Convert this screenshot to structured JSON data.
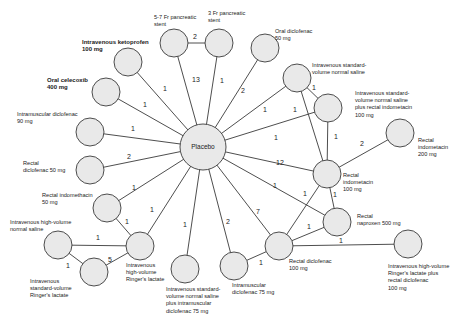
{
  "diagram": {
    "center_node": {
      "id": "placebo",
      "label": "Placebo",
      "x": 203,
      "y": 147,
      "r": 23
    },
    "nodes": [
      {
        "id": "iv_ketoprofen",
        "label": "Intravenous ketoprofen\n100 mg",
        "x": 128,
        "y": 62,
        "r": 14,
        "lx": 82,
        "ly": 39,
        "bold": true
      },
      {
        "id": "oral_celecoxib",
        "label": "Oral celecoxib\n400 mg",
        "x": 106,
        "y": 92,
        "r": 14,
        "lx": 47,
        "ly": 77,
        "bold": true
      },
      {
        "id": "im_diclofenac_90",
        "label": "Intramuscular diclofenac\n90 mg",
        "x": 90,
        "y": 132,
        "r": 14,
        "lx": 17,
        "ly": 111
      },
      {
        "id": "rectal_diclofenac_50",
        "label": "Rectal\ndiclofenac 50 mg",
        "x": 90,
        "y": 170,
        "r": 14,
        "lx": 23,
        "ly": 160
      },
      {
        "id": "rectal_indomethacin_50",
        "label": "Rectal indomethacin\n50 mg",
        "x": 107,
        "y": 208,
        "r": 14,
        "lx": 42,
        "ly": 192
      },
      {
        "id": "iv_hv_ns",
        "label": "Intravenous high-volume\nnormal saline",
        "x": 58,
        "y": 245,
        "r": 14,
        "lx": 10,
        "ly": 219
      },
      {
        "id": "iv_sv_rl",
        "label": "Intravenous\nstandard-volume\nRinger's lactate",
        "x": 94,
        "y": 272,
        "r": 14,
        "lx": 30,
        "ly": 278
      },
      {
        "id": "iv_hv_rl",
        "label": "Intravenous\nhigh-volume\nRinger's lactate",
        "x": 140,
        "y": 246,
        "r": 14,
        "lx": 126,
        "ly": 262
      },
      {
        "id": "iv_sv_ns_im_dic",
        "label": "Intravenous standard-\nvolume normal saline\nplus intramuscular\ndiclofenac 75 mg",
        "x": 185,
        "y": 269,
        "r": 14,
        "lx": 166,
        "ly": 286
      },
      {
        "id": "im_diclofenac_75",
        "label": "Intramuscular\ndiclofenac 75 mg",
        "x": 234,
        "y": 266,
        "r": 14,
        "lx": 232,
        "ly": 282
      },
      {
        "id": "rectal_diclofenac_100",
        "label": "Rectal diclofenac\n100 mg",
        "x": 279,
        "y": 246,
        "r": 14,
        "lx": 289,
        "ly": 258
      },
      {
        "id": "rectal_naproxen_500",
        "label": "Rectal\nnaproxen 500 mg",
        "x": 337,
        "y": 222,
        "r": 14,
        "lx": 357,
        "ly": 213
      },
      {
        "id": "iv_hv_rl_rectal_dic",
        "label": "Intravenous high-volume\nRinger's lactate plus\nrectal diclofenac\n100 mg",
        "x": 408,
        "y": 244,
        "r": 14,
        "lx": 388,
        "ly": 263
      },
      {
        "id": "rectal_indomethacin_100",
        "label": "Rectal\nindometacin\n100 mg",
        "x": 327,
        "y": 174,
        "r": 14,
        "lx": 343,
        "ly": 172
      },
      {
        "id": "rectal_indomethacin_200",
        "label": "Rectal\nindometacin\n200 mg",
        "x": 400,
        "y": 133,
        "r": 14,
        "lx": 418,
        "ly": 137
      },
      {
        "id": "iv_sv_ns_rectal_indo",
        "label": "Intravenous standard-\nvolume normal saline\nplus rectal indometacin\n100 mg",
        "x": 328,
        "y": 108,
        "r": 14,
        "lx": 355,
        "ly": 90
      },
      {
        "id": "iv_sv_ns",
        "label": "Intravenous standard-\nvolume normal saline",
        "x": 297,
        "y": 78,
        "r": 14,
        "lx": 312,
        "ly": 62
      },
      {
        "id": "oral_diclofenac",
        "label": "Oral diclofenac\n50 mg",
        "x": 265,
        "y": 48,
        "r": 14,
        "lx": 275,
        "ly": 28
      },
      {
        "id": "stent_3fr",
        "label": "3 Fr pancreatic\nstent",
        "x": 219,
        "y": 43,
        "r": 14,
        "lx": 208,
        "ly": 10
      },
      {
        "id": "stent_5_7fr",
        "label": "5-7 Fr pancreatic\nstent",
        "x": 174,
        "y": 43,
        "r": 14,
        "lx": 154,
        "ly": 14
      }
    ],
    "edges": [
      {
        "a": "placebo",
        "b": "iv_ketoprofen",
        "n": "1",
        "lx": 165,
        "ly": 91
      },
      {
        "a": "placebo",
        "b": "oral_celecoxib",
        "n": "1",
        "lx": 145,
        "ly": 107
      },
      {
        "a": "placebo",
        "b": "im_diclofenac_90",
        "n": "1",
        "lx": 133,
        "ly": 131
      },
      {
        "a": "placebo",
        "b": "rectal_diclofenac_50",
        "n": "2",
        "lx": 129,
        "ly": 159
      },
      {
        "a": "placebo",
        "b": "rectal_indomethacin_50",
        "n": "1",
        "lx": 134,
        "ly": 190
      },
      {
        "a": "placebo",
        "b": "iv_hv_rl",
        "n": "1",
        "lx": 152,
        "ly": 212
      },
      {
        "a": "placebo",
        "b": "iv_sv_ns_im_dic",
        "n": "1",
        "lx": 185,
        "ly": 227
      },
      {
        "a": "placebo",
        "b": "im_diclofenac_75",
        "n": "2",
        "lx": 228,
        "ly": 224
      },
      {
        "a": "placebo",
        "b": "rectal_diclofenac_100",
        "n": "7",
        "lx": 258,
        "ly": 214
      },
      {
        "a": "placebo",
        "b": "rectal_naproxen_500",
        "n": "1",
        "lx": 275,
        "ly": 188
      },
      {
        "a": "placebo",
        "b": "rectal_indomethacin_100",
        "n": "12",
        "lx": 280,
        "ly": 165
      },
      {
        "a": "placebo",
        "b": "iv_sv_ns_rectal_indo",
        "n": "1",
        "lx": 276,
        "ly": 140
      },
      {
        "a": "placebo",
        "b": "iv_sv_ns",
        "n": "1",
        "lx": 265,
        "ly": 112
      },
      {
        "a": "placebo",
        "b": "oral_diclofenac",
        "n": "2",
        "lx": 243,
        "ly": 93
      },
      {
        "a": "placebo",
        "b": "stent_3fr",
        "n": "1",
        "lx": 222,
        "ly": 83
      },
      {
        "a": "placebo",
        "b": "stent_5_7fr",
        "n": "13",
        "lx": 196,
        "ly": 82
      },
      {
        "a": "stent_5_7fr",
        "b": "stent_3fr",
        "n": "2",
        "lx": 195,
        "ly": 39
      },
      {
        "a": "iv_sv_ns",
        "b": "iv_sv_ns_rectal_indo",
        "n": "1",
        "lx": 314,
        "ly": 90
      },
      {
        "a": "iv_sv_ns",
        "b": "rectal_indomethacin_100",
        "n": "1",
        "lx": 295,
        "ly": 112
      },
      {
        "a": "iv_sv_ns_rectal_indo",
        "b": "rectal_indomethacin_100",
        "n": "1",
        "lx": 336,
        "ly": 139
      },
      {
        "a": "rectal_indomethacin_100",
        "b": "rectal_indomethacin_200",
        "n": "2",
        "lx": 362,
        "ly": 146
      },
      {
        "a": "rectal_indomethacin_100",
        "b": "rectal_diclofenac_100",
        "n": "1",
        "lx": 305,
        "ly": 196
      },
      {
        "a": "rectal_indomethacin_100",
        "b": "rectal_naproxen_500",
        "n": "1",
        "lx": 335,
        "ly": 197
      },
      {
        "a": "rectal_diclofenac_100",
        "b": "rectal_naproxen_500",
        "n": "1",
        "lx": 309,
        "ly": 229
      },
      {
        "a": "rectal_diclofenac_100",
        "b": "iv_hv_rl_rectal_dic",
        "n": "1",
        "lx": 341,
        "ly": 243
      },
      {
        "a": "rectal_diclofenac_100",
        "b": "im_diclofenac_75",
        "n": "1",
        "lx": 261,
        "ly": 265
      },
      {
        "a": "rectal_indomethacin_50",
        "b": "iv_hv_rl",
        "n": "1",
        "lx": 127,
        "ly": 224
      },
      {
        "a": "iv_hv_ns",
        "b": "iv_hv_rl",
        "n": "1",
        "lx": 98,
        "ly": 240
      },
      {
        "a": "iv_hv_ns",
        "b": "iv_sv_rl",
        "n": "1",
        "lx": 68,
        "ly": 268
      },
      {
        "a": "iv_sv_rl",
        "b": "iv_hv_rl",
        "n": "5",
        "lx": 110,
        "ly": 262
      }
    ]
  }
}
